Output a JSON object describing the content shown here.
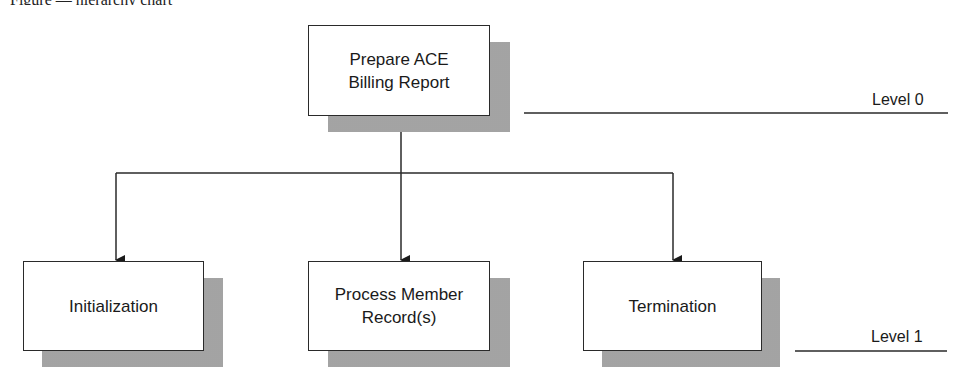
{
  "diagram": {
    "type": "hierarchy-chart",
    "caption_partial": "Figure — hierarchy chart",
    "root": {
      "id": "prepare-ace-billing-report",
      "lines": [
        "Prepare ACE",
        "Billing Report"
      ]
    },
    "children": [
      {
        "id": "initialization",
        "lines": [
          "Initialization"
        ]
      },
      {
        "id": "process-member-records",
        "lines": [
          "Process Member",
          "Record(s)"
        ]
      },
      {
        "id": "termination",
        "lines": [
          "Termination"
        ]
      }
    ],
    "levels": [
      {
        "label": "Level 0"
      },
      {
        "label": "Level 1"
      }
    ],
    "colors": {
      "line": "#2a2a2a",
      "shadow": "#b5b5b5",
      "box_fill": "#ffffff"
    }
  }
}
